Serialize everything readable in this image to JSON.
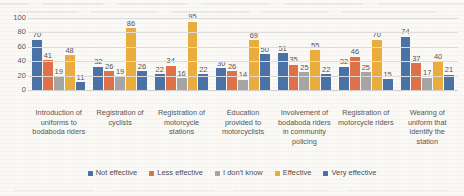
{
  "chart_data": {
    "type": "bar",
    "title": "",
    "subtitle": "",
    "xlabel": "",
    "ylabel": "",
    "ylim": [
      0,
      100
    ],
    "yticks": [
      0,
      20,
      40,
      60,
      80,
      100
    ],
    "grid": true,
    "legend_position": "bottom",
    "orientation": "vertical",
    "grouping": "clustered",
    "categories": [
      "Introduction of uniforms to bodaboda riders",
      "Registration of cyclists",
      "Registration of motorcycle stations",
      "Education provided to motorcyclists",
      "Involvement of bodaboda riders in community policing",
      "Registration of motorcycle riders",
      "Wearing of uniform that identify the station"
    ],
    "series": [
      {
        "name": "Not effective",
        "color": "#4a72a6",
        "values": [
          70,
          32,
          22,
          30,
          51,
          32,
          74
        ]
      },
      {
        "name": "Less effective",
        "color": "#df7149",
        "values": [
          41,
          26,
          34,
          26,
          35,
          46,
          37
        ]
      },
      {
        "name": "I don't know",
        "color": "#a5a5a5",
        "values": [
          19,
          19,
          16,
          14,
          25,
          25,
          17
        ]
      },
      {
        "name": "Effective",
        "color": "#eaac3c",
        "values": [
          48,
          86,
          95,
          69,
          55,
          70,
          40
        ]
      },
      {
        "name": "Very effective",
        "color": "#4a72a6",
        "values": [
          11,
          26,
          22,
          50,
          22,
          15,
          21
        ]
      }
    ]
  }
}
